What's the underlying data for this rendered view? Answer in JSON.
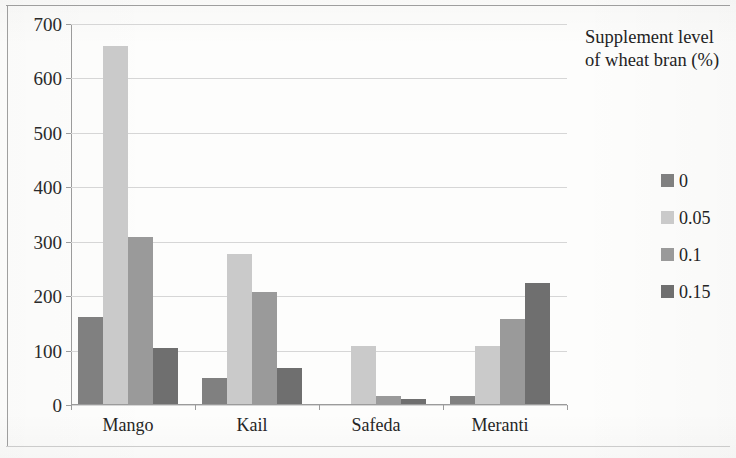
{
  "chart_data": {
    "type": "bar",
    "title": "",
    "xlabel": "",
    "ylabel": "",
    "categories": [
      "Mango",
      "Kail",
      "Safeda",
      "Meranti"
    ],
    "ylim": [
      0,
      700
    ],
    "yticks": [
      0,
      100,
      200,
      300,
      400,
      500,
      600,
      700
    ],
    "grid": true,
    "legend_position": "right",
    "legend_title": "Supplement level of wheat bran (%)",
    "series": [
      {
        "name": "0",
        "color": "#808080",
        "values": [
          160,
          48,
          0,
          15
        ]
      },
      {
        "name": "0.05",
        "color": "#cacaca",
        "values": [
          658,
          276,
          107,
          107
        ]
      },
      {
        "name": "0.1",
        "color": "#9a9a9a",
        "values": [
          307,
          205,
          15,
          157
        ]
      },
      {
        "name": "0.15",
        "color": "#6f6f6f",
        "values": [
          103,
          67,
          10,
          222
        ]
      }
    ]
  },
  "legend": {
    "title_line1": "Supplement level",
    "title_line2": "of wheat bran (%)"
  }
}
